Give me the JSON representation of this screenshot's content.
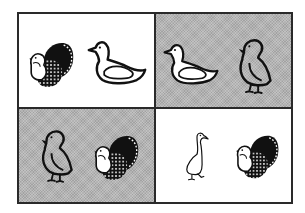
{
  "colors": {
    "border": "#2a2a2a",
    "white_panel": "#ffffff",
    "gray_panel": "#b4b4b4",
    "ink": "#111111"
  },
  "panels": [
    {
      "position": "top-left",
      "background": "white",
      "birds": [
        "turkey",
        "duck"
      ]
    },
    {
      "position": "top-right",
      "background": "gray",
      "birds": [
        "duck",
        "chick"
      ]
    },
    {
      "position": "bottom-left",
      "background": "gray",
      "birds": [
        "chick",
        "turkey"
      ]
    },
    {
      "position": "bottom-right",
      "background": "white",
      "birds": [
        "goose",
        "turkey"
      ]
    }
  ]
}
